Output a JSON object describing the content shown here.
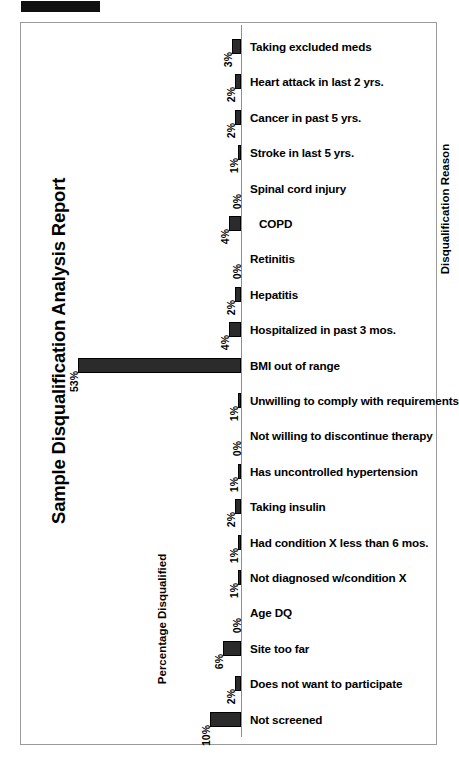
{
  "redaction": {
    "present": true,
    "label": "redacted-header-block"
  },
  "chart_title": "Sample Disqualification Analysis Report",
  "colors": {
    "bar_fill": "#2b2b2b",
    "bar_stroke": "#000000",
    "frame": "#9a9a9a",
    "axis": "#8e8e8e",
    "text": "#000000",
    "background": "#ffffff"
  },
  "chart_data": {
    "type": "bar",
    "orientation": "horizontal-left",
    "title": "Sample Disqualification Analysis Report",
    "xlabel": "Percentage Disqualified",
    "ylabel": "Disqualification Reason",
    "grid": false,
    "legend": false,
    "xlim": [
      0,
      55
    ],
    "value_suffix": "%",
    "categories": [
      "Taking excluded meds",
      "Heart attack in last 2 yrs.",
      "Cancer in past 5 yrs.",
      "Stroke in last 5 yrs.",
      "Spinal cord injury",
      "COPD",
      "Retinitis",
      "Hepatitis",
      "Hospitalized in past 3 mos.",
      "BMI out of range",
      "Unwilling to comply with requirements",
      "Not willing to discontinue therapy",
      "Has uncontrolled hypertension",
      "Taking insulin",
      "Had condition X less than 6 mos.",
      "Not diagnosed w/condition X",
      "Age DQ",
      "Site too far",
      "Does not want to participate",
      "Not screened"
    ],
    "values": [
      3,
      2,
      2,
      1,
      0,
      4,
      0,
      2,
      4,
      53,
      1,
      0,
      1,
      2,
      1,
      1,
      0,
      6,
      2,
      10
    ],
    "value_labels": [
      "3%",
      "2%",
      "2%",
      "1%",
      "0%",
      "4%",
      "0%",
      "2%",
      "4%",
      "53%",
      "1%",
      "0%",
      "1%",
      "2%",
      "1%",
      "1%",
      "0%",
      "6%",
      "2%",
      "10%"
    ]
  },
  "axis_labels": {
    "value_axis": "Percentage Disqualified",
    "category_axis": "Disqualification Reason"
  }
}
